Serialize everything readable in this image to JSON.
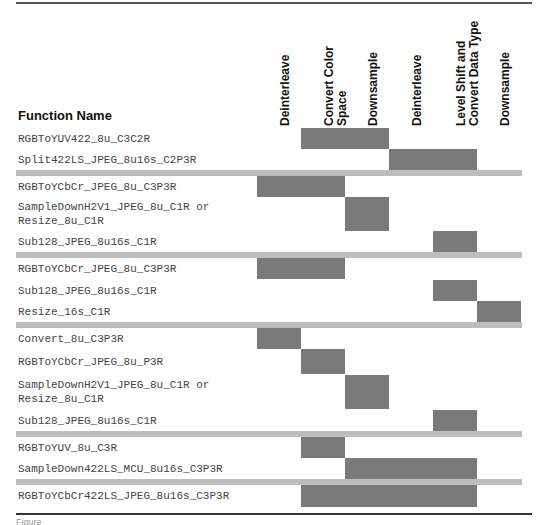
{
  "table": {
    "function_header": "Function Name",
    "columns": [
      {
        "label": "Deinterleave",
        "x": 257
      },
      {
        "label": "Convert Color\nSpace",
        "x": 301
      },
      {
        "label": "Downsample",
        "x": 345
      },
      {
        "label": "Deinterleave",
        "x": 389
      },
      {
        "label": "Level Shift and\nConvert Data Type",
        "x": 433
      },
      {
        "label": "Downsample",
        "x": 477
      }
    ],
    "column_width": 44,
    "bar_color": "#7a7a7a",
    "separator_color": "#bdbdbd",
    "rows": [
      {
        "name": "RGBToYUV422_8u_C3C2R",
        "top": 128,
        "height": 21,
        "span": [
          2,
          3
        ]
      },
      {
        "name": "Split422LS_JPEG_8u16s_C2P3R",
        "top": 149,
        "height": 21,
        "span": [
          4,
          5
        ]
      },
      {
        "separator": true,
        "top": 170
      },
      {
        "name": "RGBToYCbCr_JPEG_8u_C3P3R",
        "top": 176,
        "height": 21,
        "span": [
          1,
          2
        ]
      },
      {
        "name": "SampleDownH2V1_JPEG_8u_C1R or\nResize_8u_C1R",
        "top": 197,
        "height": 34,
        "span": [
          3,
          3
        ]
      },
      {
        "name": "Sub128_JPEG_8u16s_C1R",
        "top": 231,
        "height": 21,
        "span": [
          5,
          5
        ]
      },
      {
        "separator": true,
        "top": 252
      },
      {
        "name": "RGBToYCbCr_JPEG_8u_C3P3R",
        "top": 258,
        "height": 21,
        "span": [
          1,
          2
        ]
      },
      {
        "name": "Sub128_JPEG_8u16s_C1R",
        "top": 280,
        "height": 21,
        "span": [
          5,
          5
        ]
      },
      {
        "name": "Resize_16s_C1R",
        "top": 301,
        "height": 21,
        "span": [
          6,
          6
        ]
      },
      {
        "separator": true,
        "top": 322
      },
      {
        "name": "Convert_8u_C3P3R",
        "top": 328,
        "height": 21,
        "span": [
          1,
          1
        ]
      },
      {
        "name": "RGBToYCbCr_JPEG_8u_P3R",
        "top": 349,
        "height": 25,
        "span": [
          2,
          2
        ]
      },
      {
        "name": "SampleDownH2V1_JPEG_8u_C1R or\nResize_8u_C1R",
        "top": 375,
        "height": 34,
        "span": [
          3,
          3
        ]
      },
      {
        "name": "Sub128_JPEG_8u16s_C1R",
        "top": 410,
        "height": 21,
        "span": [
          5,
          5
        ]
      },
      {
        "separator": true,
        "top": 431
      },
      {
        "name": "RGBToYUV_8u_C3R",
        "top": 437,
        "height": 21,
        "span": [
          2,
          2
        ]
      },
      {
        "name": "SampleDown422LS_MCU_8u16s_C3P3R",
        "top": 458,
        "height": 21,
        "span": [
          3,
          5
        ]
      },
      {
        "separator": true,
        "top": 479
      },
      {
        "name": "RGBToYCbCr422LS_JPEG_8u16s_C3P3R",
        "top": 485,
        "height": 22,
        "span": [
          2,
          5
        ]
      }
    ]
  },
  "caption": "Figure"
}
